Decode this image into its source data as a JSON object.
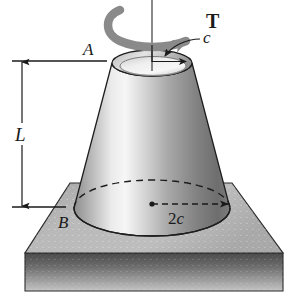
{
  "figure": {
    "background_color": "#ffffff",
    "line_color": "#1a1a1a",
    "torque_arrow_color": "#8a8a8a",
    "cone_light_color": "#f2f2f2",
    "cone_mid_color": "#bdbdbd",
    "cone_dark_color": "#6e6e6e",
    "plate_top_color": "#b5b5b5",
    "plate_front_color": "#5a5a5a"
  },
  "labels": {
    "torque": "T",
    "top_radius": "c",
    "base_diameter": "2c",
    "length": "L",
    "section_top": "A",
    "section_bottom": "B"
  },
  "annotations": {
    "axis_name": "vertical-axis-of-revolution",
    "torque_sense": "counterclockwise-about-vertical-axis",
    "hidden_edge_style": "dashed",
    "dimension_line_style": "double-arrow"
  },
  "geometry": {
    "axis_x": 152,
    "top_center_y": 63,
    "top_radius_px": 40,
    "top_ellipse_ry": 13,
    "base_center_y": 208,
    "base_radius_px": 78,
    "base_ellipse_ry": 28,
    "length_dim_top_y": 61,
    "length_dim_bottom_y": 207
  }
}
